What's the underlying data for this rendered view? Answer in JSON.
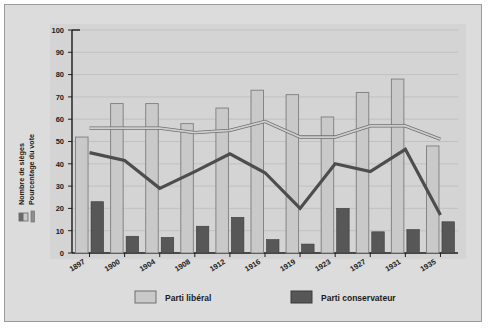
{
  "figure": {
    "background_color": "#dcdcdc",
    "frame_color": "#9a9a9a",
    "plot_background": "#d4d4d4"
  },
  "axis_labels": {
    "seats": "Nombre de sièges",
    "vote_pct": "Pourcentage du vote"
  },
  "legend_bottom": [
    {
      "label": "Parti libéral",
      "color": "#c9c9c9"
    },
    {
      "label": "Parti conservateur",
      "color": "#575757"
    }
  ],
  "legend_left": [
    {
      "name": "seats-swatch",
      "color": "#c9c9c9"
    },
    {
      "name": "vote-line-swatch",
      "color": "#8f8f8f"
    }
  ],
  "yticks": [
    "0",
    "10",
    "20",
    "30",
    "40",
    "50",
    "60",
    "70",
    "80",
    "90",
    "100"
  ],
  "chart_data": {
    "type": "bar",
    "title": "",
    "xlabel": "",
    "ylabel": "Nombre de sièges / Pourcentage du vote",
    "ylim": [
      0,
      100
    ],
    "grid": true,
    "legend_position": "bottom",
    "categories": [
      "1897",
      "1900",
      "1904",
      "1908",
      "1912",
      "1916",
      "1919",
      "1923",
      "1927",
      "1931",
      "1935"
    ],
    "series": [
      {
        "name": "Parti libéral",
        "kind": "bar",
        "unit": "Nombre de sièges",
        "color": "#c9c9c9",
        "values": [
          52,
          67,
          67,
          58,
          65,
          73,
          71,
          61,
          72,
          78,
          48
        ]
      },
      {
        "name": "Parti conservateur",
        "kind": "bar",
        "unit": "Nombre de sièges",
        "color": "#575757",
        "values": [
          23,
          7.5,
          7,
          12,
          16,
          6,
          4,
          20,
          9.5,
          10.5,
          14
        ]
      },
      {
        "name": "Parti libéral",
        "kind": "line",
        "unit": "Pourcentage du vote",
        "color": "#9a9a9a",
        "values": [
          56,
          56,
          56,
          54,
          55,
          59,
          52,
          52,
          57,
          57,
          51
        ]
      },
      {
        "name": "Parti conservateur",
        "kind": "line",
        "unit": "Pourcentage du vote",
        "color": "#4d4d4d",
        "values": [
          45,
          41.5,
          29,
          36.5,
          44.5,
          36,
          20,
          40,
          36.5,
          46.5,
          17
        ]
      }
    ]
  }
}
